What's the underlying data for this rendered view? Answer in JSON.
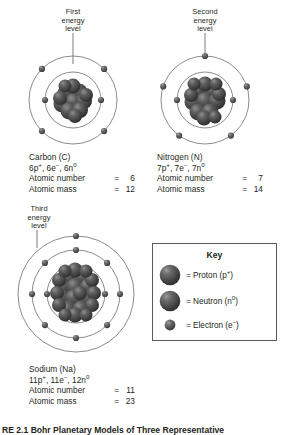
{
  "figure": {
    "caption": "RE 2.1 Bohr Planetary Models of Three Representative"
  },
  "callouts": {
    "first": "First\nenergy\nlevel",
    "second": "Second\nenergy\nlevel",
    "third": "Third\nenergy\nlevel"
  },
  "atoms": [
    {
      "id": "carbon",
      "name": "Carbon (C)",
      "composition_parts": [
        {
          "text": "6p",
          "sup": "+"
        },
        {
          "text": ", 6e",
          "sup": "–"
        },
        {
          "text": ", 6n",
          "sup": "0"
        }
      ],
      "composition_plain": "6p+, 6e-, 6n0",
      "atomic_number_label": "Atomic number",
      "atomic_number_value": "6",
      "atomic_mass_label": "Atomic mass",
      "atomic_mass_value": "12",
      "equals": "=",
      "shells": [
        2,
        4
      ],
      "nucleus_particles": 12
    },
    {
      "id": "nitrogen",
      "name": "Nitrogen (N)",
      "composition_parts": [
        {
          "text": "7p",
          "sup": "+"
        },
        {
          "text": ", 7e",
          "sup": "–"
        },
        {
          "text": ", 7n",
          "sup": "0"
        }
      ],
      "composition_plain": "7p+, 7e-, 7n0",
      "atomic_number_label": "Atomic number",
      "atomic_number_value": "7",
      "atomic_mass_label": "Atomic mass",
      "atomic_mass_value": "14",
      "equals": "=",
      "shells": [
        2,
        5
      ],
      "nucleus_particles": 14
    },
    {
      "id": "sodium",
      "name": "Sodium (Na)",
      "composition_parts": [
        {
          "text": "11p",
          "sup": "+"
        },
        {
          "text": ", 11e",
          "sup": "–"
        },
        {
          "text": ", 12n",
          "sup": "0"
        }
      ],
      "composition_plain": "11p+, 11e-, 12n0",
      "atomic_number_label": "Atomic number",
      "atomic_number_value": "11",
      "atomic_mass_label": "Atomic mass",
      "atomic_mass_value": "23",
      "equals": "=",
      "shells": [
        2,
        8,
        1
      ],
      "nucleus_particles": 23
    }
  ],
  "key": {
    "title": "Key",
    "items": [
      {
        "glyph": "proton-sphere",
        "prefix": "= Proton (p",
        "sup": "+",
        "suffix": ")",
        "label_plain": "= Proton (p+)",
        "size": "large"
      },
      {
        "glyph": "neutron-sphere",
        "prefix": "= Neutron (n",
        "sup": "0",
        "suffix": ")",
        "label_plain": "= Neutron (n0)",
        "size": "large"
      },
      {
        "glyph": "electron-sphere",
        "prefix": "= Electron (e",
        "sup": "–",
        "suffix": ")",
        "label_plain": "= Electron (e-)",
        "size": "small"
      }
    ]
  },
  "colors": {
    "background": "#ffffff",
    "text": "#231f20",
    "orbit_line": "#6d6d6d",
    "sphere_dark": "#3a3a3a",
    "sphere_mid": "#595959",
    "sphere_highlight": "#b8b8b8",
    "key_border": "#5a5a5a",
    "pointer_line": "#6d6d6d"
  }
}
